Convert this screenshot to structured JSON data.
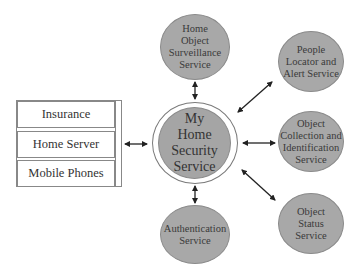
{
  "diagram": {
    "center": {
      "label": "My\nHome\nSecurity\nService"
    },
    "left_stack": {
      "rows": [
        {
          "label": "Insurance"
        },
        {
          "label": "Home Server"
        },
        {
          "label": "Mobile Phones"
        }
      ]
    },
    "services": [
      {
        "id": "surveillance",
        "label": "Home\nObject\nSurveillance\nService"
      },
      {
        "id": "people-locator",
        "label": "People\nLocator and\nAlert Service"
      },
      {
        "id": "object-collection",
        "label": "Object\nCollection and\nIdentification\nService"
      },
      {
        "id": "object-status",
        "label": "Object\nStatus\nService"
      },
      {
        "id": "authentication",
        "label": "Authentication\nService"
      }
    ],
    "connections": [
      {
        "from": "left_stack",
        "to": "center",
        "type": "bidirectional"
      },
      {
        "from": "surveillance",
        "to": "center",
        "type": "bidirectional"
      },
      {
        "from": "people-locator",
        "to": "center",
        "type": "bidirectional"
      },
      {
        "from": "object-collection",
        "to": "center",
        "type": "bidirectional"
      },
      {
        "from": "object-status",
        "to": "center",
        "type": "bidirectional"
      },
      {
        "from": "authentication",
        "to": "center",
        "type": "bidirectional"
      }
    ],
    "colors": {
      "node_fill": "#a8a8a8",
      "node_border": "#8a8a8a",
      "arrow": "#222222",
      "ring": "#7a7a7a"
    }
  }
}
